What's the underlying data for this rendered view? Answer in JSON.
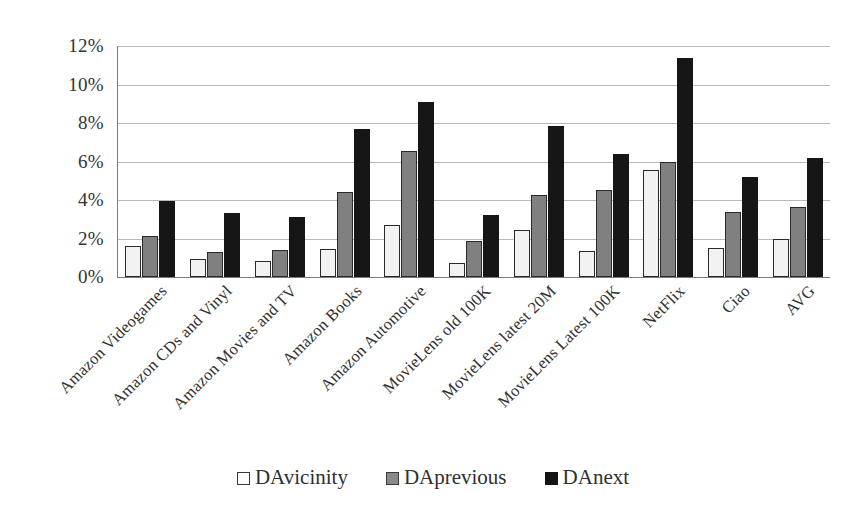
{
  "chart_data": {
    "type": "bar",
    "title": "",
    "subtitle": "",
    "xlabel": "",
    "ylabel": "",
    "ylim": [
      0,
      12
    ],
    "ytick_labels": [
      "12%",
      "10%",
      "8%",
      "6%",
      "4%",
      "2%",
      "0%"
    ],
    "ytick_values": [
      12,
      10,
      8,
      6,
      4,
      2,
      0
    ],
    "grid": true,
    "legend_position": "bottom",
    "value_format": "percent",
    "categories": [
      "Amazon Videogames",
      "Amazon CDs and Vinyl",
      "Amazon Movies and TV",
      "Amazon Books",
      "Amazon Automotive",
      "MovieLens old 100K",
      "MovieLens latest 20M",
      "MovieLens Latest 100K",
      "NetFlix",
      "Ciao",
      "AVG"
    ],
    "series": [
      {
        "name": "DAvicinity",
        "color": "#f2f2f2",
        "values": [
          1.6,
          0.95,
          0.85,
          1.45,
          2.7,
          0.75,
          2.45,
          1.35,
          5.55,
          1.5,
          2.0
        ]
      },
      {
        "name": "DAprevious",
        "color": "#808080",
        "values": [
          2.15,
          1.3,
          1.4,
          4.4,
          6.55,
          1.85,
          4.25,
          4.5,
          5.95,
          3.4,
          3.65
        ]
      },
      {
        "name": "DAnext",
        "color": "#161616",
        "values": [
          3.95,
          3.35,
          3.1,
          7.7,
          9.1,
          3.2,
          7.85,
          6.4,
          11.4,
          5.2,
          6.2
        ]
      }
    ]
  },
  "legend": {
    "items": [
      {
        "label": "DAvicinity",
        "swatch": "legend-swatch-vicinity"
      },
      {
        "label": "DAprevious",
        "swatch": "legend-swatch-previous"
      },
      {
        "label": "DAnext",
        "swatch": "legend-swatch-next"
      }
    ]
  }
}
